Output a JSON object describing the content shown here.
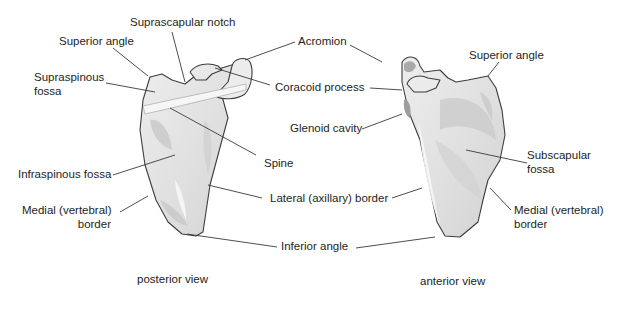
{
  "figure": {
    "title": "Scapula",
    "views": [
      {
        "id": "posterior",
        "caption": "posterior view"
      },
      {
        "id": "anterior",
        "caption": "anterior view"
      }
    ]
  },
  "labels": {
    "suprascapular_notch": "Suprascapular notch",
    "superior_angle_posterior": "Superior angle",
    "acromion": "Acromion",
    "superior_angle_anterior": "Superior angle",
    "supraspinous_fossa_line1": "Supraspinous",
    "supraspinous_fossa_line2": "fossa",
    "coracoid_process": "Coracoid process",
    "glenoid_cavity": "Glenoid cavity",
    "spine": "Spine",
    "subscapular_fossa_line1": "Subscapular",
    "subscapular_fossa_line2": "fossa",
    "infraspinous_fossa": "Infraspinous fossa",
    "lateral_border": "Lateral (axillary) border",
    "medial_border_posterior_line1": "Medial (vertebral)",
    "medial_border_posterior_line2": "border",
    "medial_border_anterior_line1": "Medial (vertebral)",
    "medial_border_anterior_line2": "border",
    "inferior_angle": "Inferior angle"
  },
  "colors": {
    "bone_fill": "#e4e4e4",
    "bone_shade": "#c9c9c9",
    "bone_highlight": "#f7f7f7",
    "outline": "#3d3d3d",
    "leader": "#3a3a3a",
    "text": "#1e1e1e"
  }
}
